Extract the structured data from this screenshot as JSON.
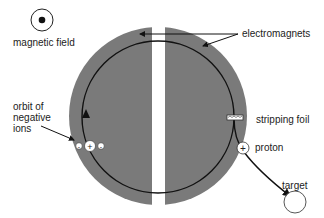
{
  "diagram": {
    "type": "cyclotron schematic",
    "labels": {
      "magnetic_field": "magnetic field",
      "electromagnets": "electromagnets",
      "orbit_line1": "orbit of",
      "orbit_line2": "negative",
      "orbit_line3": "ions",
      "stripping_foil": "stripping foil",
      "proton": "proton",
      "target": "target"
    },
    "symbols": {
      "proton_sign": "+",
      "ion_center_sign": "+",
      "electron_sign": "-"
    },
    "colors": {
      "magnet_fill": "#7a7a7a",
      "line": "#111111",
      "background": "#ffffff"
    }
  }
}
